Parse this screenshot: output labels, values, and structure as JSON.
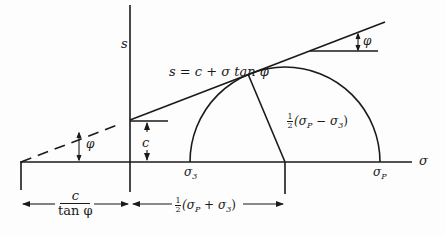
{
  "diagram": {
    "type": "Mohr-Coulomb failure envelope",
    "axes": {
      "vertical_label": "s",
      "horizontal_label": "σ"
    },
    "envelope_equation": "s = c + σ tan φ",
    "angle_label": "φ",
    "intercept_label": "c",
    "circle": {
      "left_label": "σ",
      "left_sub": "3",
      "right_label": "σ",
      "right_sub": "P",
      "radius_label": {
        "prefix_num": "1",
        "prefix_den": "2",
        "expr": "(σ",
        "sub1": "P",
        "mid": " − σ",
        "sub2": "3",
        "close": ")"
      }
    },
    "dimensions": {
      "left": {
        "numerator": "c",
        "denominator": "tan φ"
      },
      "right": {
        "prefix_num": "1",
        "prefix_den": "2",
        "expr": "(σ",
        "sub1": "P",
        "mid": " + σ",
        "sub2": "3",
        "close": ")"
      }
    },
    "colors": {
      "line": "#1a1a1a",
      "background": "#fdfdfd"
    }
  }
}
